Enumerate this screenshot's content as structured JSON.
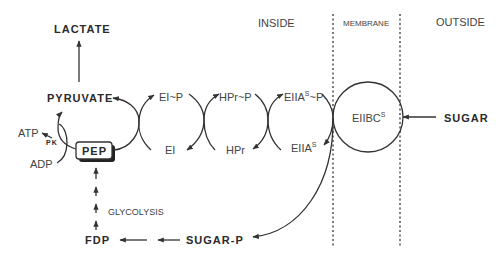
{
  "regions": {
    "inside": "INSIDE",
    "membrane": "MEMBRANE",
    "outside": "OUTSIDE"
  },
  "metabolites": {
    "lactate": "LACTATE",
    "pyruvate": "PYRUVATE",
    "pep": "PEP",
    "fdp": "FDP",
    "sugar_p": "SUGAR-P",
    "sugar": "SUGAR",
    "atp": "ATP",
    "adp": "ADP"
  },
  "enzymes": {
    "pk": "PK",
    "ei_p": "EI~P",
    "ei": "EI",
    "hpr_p": "HPr~P",
    "hpr": "HPr",
    "eiia_p_base": "EIIA",
    "eiia_p_sup": "S",
    "eiia_p_suffix": "~P",
    "eiia_base": "EIIA",
    "eiia_sup": "S",
    "eiibc_base": "EIIBC",
    "eiibc_sup": "S"
  },
  "pathway": {
    "glycolysis": "GLYCOLYSIS"
  },
  "colors": {
    "ink": "#333333",
    "background": "#ffffff"
  }
}
